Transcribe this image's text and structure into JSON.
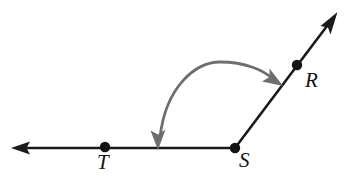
{
  "figure": {
    "width": 349,
    "height": 186,
    "background_color": "#ffffff",
    "stroke_color": "#1a1a1a",
    "arc_color": "#6e6e6e"
  },
  "labels": {
    "r": "R",
    "s": "S",
    "t": "T"
  },
  "points": [
    {
      "name": "T",
      "label": "T",
      "x": 105,
      "y": 147,
      "radius": 5
    },
    {
      "name": "S",
      "label": "S",
      "x": 235,
      "y": 148,
      "radius": 5
    },
    {
      "name": "R",
      "label": "R",
      "x": 297,
      "y": 65,
      "radius": 5
    }
  ],
  "rays": [
    {
      "name": "ray-ST",
      "from": "S",
      "direction": "left",
      "start": {
        "x": 235,
        "y": 148
      },
      "end": {
        "x": 14,
        "y": 148
      },
      "arrowhead_at_end": true
    },
    {
      "name": "ray-SR",
      "from": "S",
      "direction": "up-right",
      "start": {
        "x": 235,
        "y": 148
      },
      "end": {
        "x": 336,
        "y": 14
      },
      "arrowhead_at_end": true
    }
  ],
  "arc": {
    "name": "angle-arc",
    "double_headed": true,
    "color": "#6e6e6e",
    "start": {
      "x": 158,
      "y": 143
    },
    "apex": {
      "x": 214,
      "y": 62
    },
    "end": {
      "x": 279,
      "y": 83
    }
  }
}
